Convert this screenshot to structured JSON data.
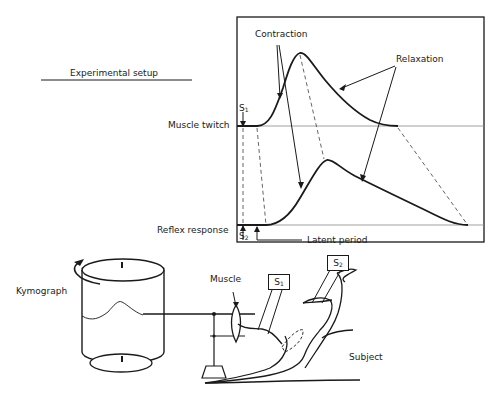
{
  "title": "Experimental setup",
  "graph": {
    "traces": {
      "muscle_twitch": "Muscle twitch",
      "reflex_response": "Reflex response"
    },
    "annotations": {
      "contraction": "Contraction",
      "relaxation": "Relaxation",
      "latent_period": "Latent period"
    },
    "stimulus_markers": {
      "s1": "S",
      "s1_sub": "1",
      "s2": "S",
      "s2_sub": "2"
    }
  },
  "apparatus": {
    "kymograph": "Kymograph",
    "muscle": "Muscle",
    "subject": "Subject",
    "stimulator_1": "S",
    "stimulator_1_sub": "1",
    "stimulator_2": "S",
    "stimulator_2_sub": "2"
  },
  "colors": {
    "ink": "#1a1a1a",
    "baseline": "#888888",
    "background": "#ffffff"
  }
}
